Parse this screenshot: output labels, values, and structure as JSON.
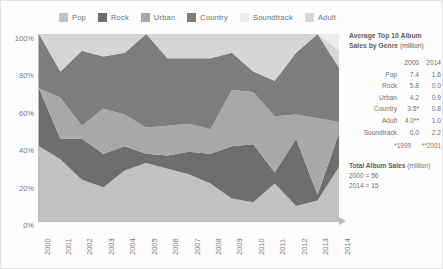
{
  "legend": {
    "items": [
      {
        "label": "Pop",
        "color": "#c2c2c2"
      },
      {
        "label": "Rock",
        "color": "#6e6e6e"
      },
      {
        "label": "Urban",
        "color": "#a8a8a8"
      },
      {
        "label": "Country",
        "color": "#7d7d7d"
      },
      {
        "label": "Soundtrack",
        "color": "#ebebeb"
      },
      {
        "label": "Adult",
        "color": "#d6d6d6"
      }
    ]
  },
  "axes": {
    "y_ticks": [
      "100%",
      "80%",
      "60%",
      "40%",
      "20%",
      "0%"
    ],
    "x_ticks": [
      "2000",
      "2001",
      "2002",
      "2003",
      "2004",
      "2005",
      "2006",
      "2007",
      "2008",
      "2009",
      "2010",
      "2011",
      "2012",
      "2013",
      "2014"
    ]
  },
  "panel": {
    "title_line1": "Average Top 10 Album",
    "title_line2": "Sales by Genre",
    "title_unit": "(million)",
    "col_headers": [
      "2000",
      "2014"
    ],
    "rows": [
      {
        "genre": "Pop",
        "v2000": "7.4",
        "v2014": "1.6"
      },
      {
        "genre": "Rock",
        "v2000": "5.8",
        "v2014": "0.0"
      },
      {
        "genre": "Urban",
        "v2000": "4.2",
        "v2014": "0.9"
      },
      {
        "genre": "Country",
        "v2000": "3.5*",
        "v2014": "0.8"
      },
      {
        "genre": "Adult",
        "v2000": "4.0**",
        "v2014": "1.0"
      },
      {
        "genre": "Soundtrack",
        "v2000": "0.0",
        "v2014": "2.2"
      }
    ],
    "footnote_1": "*1999",
    "footnote_2": "**2001",
    "totals_title": "Total Album Sales",
    "totals_unit": "(million)",
    "totals_line1": "2000 = 56",
    "totals_line2": "2014 = 15"
  },
  "chart_data": {
    "type": "area",
    "xlabel": "",
    "ylabel": "",
    "ylim": [
      0,
      100
    ],
    "grid": false,
    "legend_position": "top",
    "stacked": true,
    "normalized_percent": true,
    "x": [
      "2000",
      "2001",
      "2002",
      "2003",
      "2004",
      "2005",
      "2006",
      "2007",
      "2008",
      "2009",
      "2010",
      "2011",
      "2012",
      "2013",
      "2014"
    ],
    "series": [
      {
        "name": "Pop",
        "color": "#c2c2c2",
        "values": [
          40,
          33,
          22,
          18,
          27,
          31,
          28,
          25,
          20,
          12,
          10,
          20,
          8,
          11,
          29
        ]
      },
      {
        "name": "Rock",
        "color": "#6e6e6e",
        "values": [
          31,
          11,
          22,
          18,
          13,
          5,
          7,
          12,
          16,
          28,
          31,
          6,
          36,
          3,
          18
        ]
      },
      {
        "name": "Urban",
        "color": "#a8a8a8",
        "values": [
          0,
          22,
          7,
          24,
          17,
          14,
          16,
          15,
          13,
          30,
          28,
          30,
          13,
          41,
          6
        ]
      },
      {
        "name": "Country",
        "color": "#7d7d7d",
        "values": [
          29,
          14,
          40,
          28,
          33,
          50,
          36,
          35,
          38,
          20,
          11,
          19,
          33,
          45,
          29
        ]
      },
      {
        "name": "Adult",
        "color": "#d6d6d6",
        "values": [
          0,
          20,
          9,
          12,
          10,
          0,
          13,
          13,
          13,
          10,
          20,
          25,
          10,
          0,
          9
        ]
      },
      {
        "name": "Soundtrack",
        "color": "#ebebeb",
        "values": [
          0,
          0,
          0,
          0,
          0,
          0,
          0,
          0,
          0,
          0,
          0,
          0,
          0,
          0,
          9
        ]
      }
    ]
  }
}
